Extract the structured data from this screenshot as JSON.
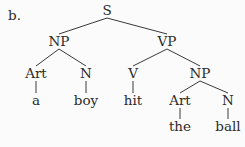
{
  "figure_label": "b.",
  "tree": {
    "nodes": [
      {
        "id": "S",
        "label": "S"
      },
      {
        "id": "NP1",
        "label": "NP"
      },
      {
        "id": "VP",
        "label": "VP"
      },
      {
        "id": "Art1",
        "label": "Art"
      },
      {
        "id": "N1",
        "label": "N"
      },
      {
        "id": "V",
        "label": "V"
      },
      {
        "id": "NP2",
        "label": "NP"
      },
      {
        "id": "a",
        "label": "a"
      },
      {
        "id": "boy",
        "label": "boy"
      },
      {
        "id": "hit",
        "label": "hit"
      },
      {
        "id": "Art2",
        "label": "Art"
      },
      {
        "id": "N2",
        "label": "N"
      },
      {
        "id": "the",
        "label": "the"
      },
      {
        "id": "ball",
        "label": "ball"
      }
    ],
    "edges": [
      [
        "S",
        "NP1"
      ],
      [
        "S",
        "VP"
      ],
      [
        "NP1",
        "Art1"
      ],
      [
        "NP1",
        "N1"
      ],
      [
        "VP",
        "V"
      ],
      [
        "VP",
        "NP2"
      ],
      [
        "Art1",
        "a"
      ],
      [
        "N1",
        "boy"
      ],
      [
        "V",
        "hit"
      ],
      [
        "NP2",
        "Art2"
      ],
      [
        "NP2",
        "N2"
      ],
      [
        "Art2",
        "the"
      ],
      [
        "N2",
        "ball"
      ]
    ]
  }
}
